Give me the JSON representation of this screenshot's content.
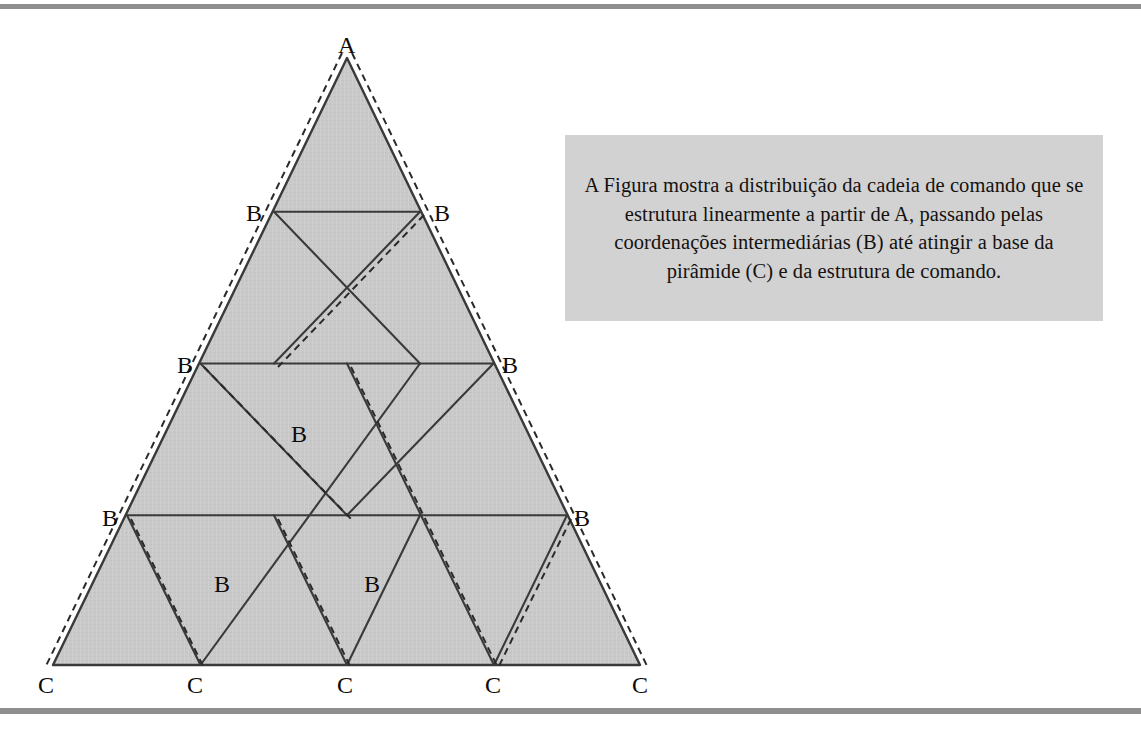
{
  "page": {
    "background": "#ffffff",
    "rule_color": "#8e8e8e",
    "width": 1141,
    "height": 732
  },
  "caption": {
    "text": "A Figura mostra a distribuição da cadeia de comando que se estrutura linearmente a partir de A, passando pelas coordenações intermediárias (B) até atingir a base da pirâmide (C) e da estrutura de comando.",
    "background": "#d2d2d2",
    "text_color": "#14110f"
  },
  "diagram": {
    "name": "pyramid-command-chain",
    "fill": "#c9c9c9",
    "stroke": "#3a3a3a",
    "dash_stroke": "#2a2a2a",
    "apex": {
      "label": "A",
      "x": 347,
      "y": 58
    },
    "base_left": {
      "x": 53,
      "y": 665
    },
    "base_right": {
      "x": 640,
      "y": 665
    },
    "rows": 4,
    "labels": [
      {
        "id": "apex-a",
        "text": "A",
        "x": 347,
        "y": 45,
        "anchor": "middle"
      },
      {
        "id": "b-r1-left",
        "text": "B",
        "x": 255,
        "y": 215,
        "anchor": "middle"
      },
      {
        "id": "b-r1-right",
        "text": "B",
        "x": 443,
        "y": 215,
        "anchor": "middle"
      },
      {
        "id": "b-r2-left",
        "text": "B",
        "x": 186,
        "y": 367,
        "anchor": "middle"
      },
      {
        "id": "b-r2-right",
        "text": "B",
        "x": 511,
        "y": 367,
        "anchor": "middle"
      },
      {
        "id": "b-mid-center",
        "text": "B",
        "x": 300,
        "y": 436,
        "anchor": "middle"
      },
      {
        "id": "b-r3-left",
        "text": "B",
        "x": 111,
        "y": 520,
        "anchor": "middle"
      },
      {
        "id": "b-r3-right",
        "text": "B",
        "x": 583,
        "y": 520,
        "anchor": "middle"
      },
      {
        "id": "b-r4-left",
        "text": "B",
        "x": 223,
        "y": 586,
        "anchor": "middle"
      },
      {
        "id": "b-r4-right",
        "text": "B",
        "x": 373,
        "y": 586,
        "anchor": "middle"
      },
      {
        "id": "c-1",
        "text": "C",
        "x": 47,
        "y": 690,
        "anchor": "middle"
      },
      {
        "id": "c-2",
        "text": "C",
        "x": 196,
        "y": 690,
        "anchor": "middle"
      },
      {
        "id": "c-3",
        "text": "C",
        "x": 346,
        "y": 690,
        "anchor": "middle"
      },
      {
        "id": "c-4",
        "text": "C",
        "x": 494,
        "y": 690,
        "anchor": "middle"
      },
      {
        "id": "c-5",
        "text": "C",
        "x": 641,
        "y": 690,
        "anchor": "middle"
      }
    ],
    "legend": {
      "a_meaning": "A",
      "b_meaning": "B",
      "c_meaning": "C"
    }
  }
}
